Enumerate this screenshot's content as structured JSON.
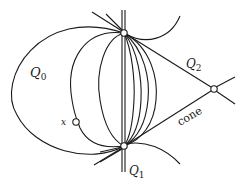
{
  "diagram": {
    "labels": {
      "q0": {
        "main": "Q",
        "sub": "0"
      },
      "q1": {
        "main": "Q",
        "sub": "1"
      },
      "q2": {
        "main": "Q",
        "sub": "2"
      },
      "cone": "cone",
      "x": "x"
    },
    "colors": {
      "stroke": "#1a1a1a",
      "background": "#ffffff",
      "point_fill": "#ffffff"
    }
  }
}
